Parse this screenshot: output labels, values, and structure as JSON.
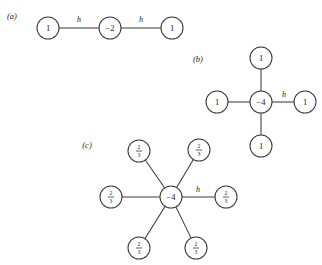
{
  "figure": {
    "background": "#ffffff",
    "stroke_color": "#3a3a3a",
    "text_color": "#1a1a1a",
    "edge_label": "h",
    "panels": [
      {
        "id": "a",
        "label": "(a)",
        "label_x": 12,
        "label_y": 16,
        "center": {
          "value": "−2",
          "x": 110,
          "y": 28,
          "r": 11
        },
        "neighbors": [
          {
            "value": "1",
            "x": 48,
            "y": 28,
            "r": 11,
            "label": "h",
            "label_x": 79,
            "label_y": 19
          },
          {
            "value": "1",
            "x": 172,
            "y": 28,
            "r": 11,
            "label": "h",
            "label_x": 141,
            "label_y": 19
          }
        ]
      },
      {
        "id": "b",
        "label": "(b)",
        "label_x": 198,
        "label_y": 59,
        "center": {
          "value": "−4",
          "x": 261,
          "y": 102,
          "r": 11
        },
        "neighbors": [
          {
            "value": "1",
            "x": 261,
            "y": 58,
            "r": 11,
            "label": "",
            "label_x": 0,
            "label_y": 0
          },
          {
            "value": "1",
            "x": 217,
            "y": 102,
            "r": 11,
            "label": "",
            "label_x": 0,
            "label_y": 0
          },
          {
            "value": "1",
            "x": 305,
            "y": 102,
            "r": 11,
            "label": "h",
            "label_x": 284,
            "label_y": 94
          },
          {
            "value": "1",
            "x": 261,
            "y": 146,
            "r": 11,
            "label": "",
            "label_x": 0,
            "label_y": 0
          }
        ]
      },
      {
        "id": "c",
        "label": "(c)",
        "label_x": 87,
        "label_y": 145,
        "center": {
          "value": "−4",
          "x": 171,
          "y": 197,
          "r": 11
        },
        "neighbors": [
          {
            "value": "2/3",
            "x": 139,
            "y": 151,
            "r": 11,
            "label": "",
            "label_x": 0,
            "label_y": 0
          },
          {
            "value": "2/3",
            "x": 199,
            "y": 150,
            "r": 11,
            "label": "",
            "label_x": 0,
            "label_y": 0
          },
          {
            "value": "2/3",
            "x": 111,
            "y": 197,
            "r": 11,
            "label": "",
            "label_x": 0,
            "label_y": 0
          },
          {
            "value": "2/3",
            "x": 226,
            "y": 197,
            "r": 11,
            "label": "h",
            "label_x": 198,
            "label_y": 189
          },
          {
            "value": "2/3",
            "x": 139,
            "y": 248,
            "r": 11,
            "label": "",
            "label_x": 0,
            "label_y": 0
          },
          {
            "value": "2/3",
            "x": 196,
            "y": 248,
            "r": 11,
            "label": "",
            "label_x": 0,
            "label_y": 0
          }
        ]
      }
    ]
  }
}
